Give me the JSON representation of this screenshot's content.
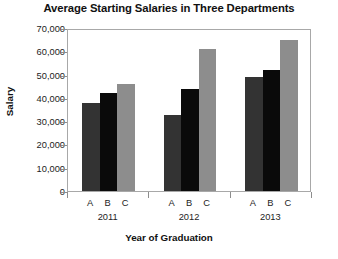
{
  "chart_data": {
    "type": "bar",
    "title": "Average Starting Salaries in Three Departments",
    "xlabel": "Year of Graduation",
    "ylabel": "Salary",
    "grid": false,
    "legend": "none",
    "ylim": [
      0,
      70000
    ],
    "ytick_labels": [
      "70,000",
      "60,000",
      "50,000",
      "40,000",
      "30,000",
      "20,000",
      "10,000",
      "0"
    ],
    "ytick_values": [
      70000,
      60000,
      50000,
      40000,
      30000,
      20000,
      10000,
      0
    ],
    "categories": [
      "2011",
      "2012",
      "2013"
    ],
    "subcategories": [
      "A",
      "B",
      "C"
    ],
    "series": [
      {
        "name": "A",
        "color": "#333333",
        "values": [
          38000,
          32500,
          49000
        ]
      },
      {
        "name": "B",
        "color": "#0a0a0a",
        "values": [
          42000,
          44000,
          52000
        ]
      },
      {
        "name": "C",
        "color": "#8d8d8d",
        "values": [
          46000,
          61000,
          65000
        ]
      }
    ],
    "groups": [
      {
        "label": "2011",
        "bars": [
          {
            "label": "A",
            "value": 38000,
            "color": "#333333"
          },
          {
            "label": "B",
            "value": 42000,
            "color": "#0a0a0a"
          },
          {
            "label": "C",
            "value": 46000,
            "color": "#8d8d8d"
          }
        ]
      },
      {
        "label": "2012",
        "bars": [
          {
            "label": "A",
            "value": 32500,
            "color": "#333333"
          },
          {
            "label": "B",
            "value": 44000,
            "color": "#0a0a0a"
          },
          {
            "label": "C",
            "value": 61000,
            "color": "#8d8d8d"
          }
        ]
      },
      {
        "label": "2013",
        "bars": [
          {
            "label": "A",
            "value": 49000,
            "color": "#333333"
          },
          {
            "label": "B",
            "value": 52000,
            "color": "#0a0a0a"
          },
          {
            "label": "C",
            "value": 65000,
            "color": "#8d8d8d"
          }
        ]
      }
    ]
  }
}
